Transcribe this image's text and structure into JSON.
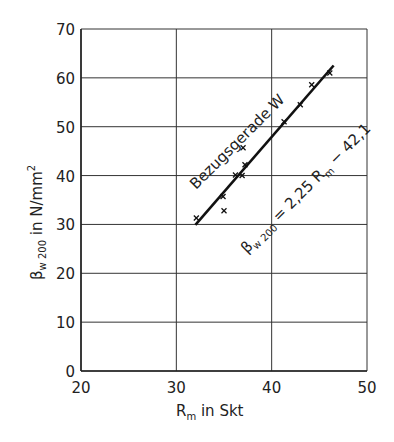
{
  "chart_data": {
    "type": "scatter",
    "title": "",
    "xlabel": "R_m in Skt",
    "ylabel": "β_w200 in N/mm²",
    "xlabel_parts": {
      "main": "R",
      "sub": "m",
      "rest": " in Skt"
    },
    "ylabel_parts": {
      "main": "β",
      "sub": "w 200",
      "rest": " in N/mm",
      "sup": "2"
    },
    "xlim": [
      20,
      50
    ],
    "ylim": [
      0,
      70
    ],
    "x_ticks": [
      20,
      30,
      40,
      50
    ],
    "y_ticks": [
      0,
      10,
      20,
      30,
      40,
      50,
      60,
      70
    ],
    "grid": true,
    "legend": null,
    "series": [
      {
        "name": "Messwerte",
        "marker": "x",
        "points": [
          [
            32.1,
            31.3
          ],
          [
            34.9,
            35.7
          ],
          [
            35.0,
            32.8
          ],
          [
            36.2,
            40.1
          ],
          [
            36.9,
            40.0
          ],
          [
            37.0,
            45.7
          ],
          [
            37.2,
            42.2
          ],
          [
            41.3,
            51.0
          ],
          [
            43.0,
            54.5
          ],
          [
            44.2,
            58.6
          ],
          [
            46.1,
            61.0
          ]
        ]
      },
      {
        "name": "Bezugsgerade W",
        "type": "line",
        "equation": "β_w200 = 2,25 R_m − 42,1",
        "slope": 2.25,
        "intercept": -42.1,
        "x_range": [
          32,
          46.5
        ]
      }
    ],
    "annotations": [
      {
        "text": "Bezugsgerade W",
        "rotation": -45
      },
      {
        "text": "β w200 = 2,25 R m − 42,1",
        "rotation": -45
      }
    ]
  },
  "text": {
    "line_label": "Bezugsgerade W",
    "eq_beta": "β",
    "eq_sub": "w 200",
    "eq_body": " = 2,25 R",
    "eq_m": "m",
    "eq_tail": " − 42,1"
  }
}
